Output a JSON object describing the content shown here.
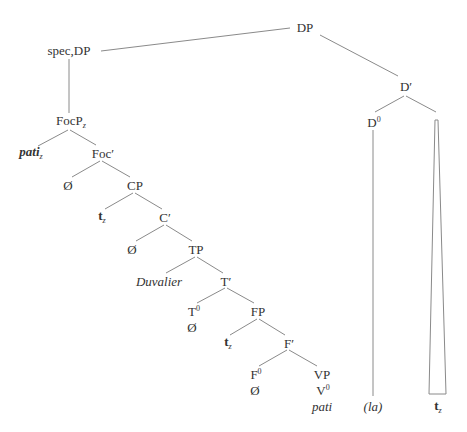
{
  "diagram": {
    "type": "syntax-tree",
    "line_color": "#8a8a8a",
    "text_color": "#333333",
    "nodes": {
      "dp": {
        "label": "DP",
        "x": 305,
        "y": 27
      },
      "spec_dp": {
        "label": "spec,DP",
        "x": 69,
        "y": 50
      },
      "d_bar": {
        "label": "D′",
        "x": 406,
        "y": 85
      },
      "d0": {
        "label": "D",
        "sup": "0",
        "x": 372,
        "y": 121
      },
      "focp": {
        "label": "FocP",
        "sub": "z",
        "x": 69,
        "y": 121
      },
      "pati_z": {
        "label": "pati",
        "sub": "z",
        "x": 30,
        "y": 152
      },
      "foc_bar": {
        "label": "Foc′",
        "x": 101,
        "y": 152
      },
      "null_foc": {
        "label": "Ø",
        "x": 68,
        "y": 184
      },
      "cp": {
        "label": "CP",
        "x": 134,
        "y": 184
      },
      "t_z_cp": {
        "label": "t",
        "sub": "z",
        "x": 101,
        "y": 216
      },
      "c_bar": {
        "label": "C′",
        "x": 165,
        "y": 216
      },
      "null_c": {
        "label": "Ø",
        "x": 132,
        "y": 248
      },
      "tp": {
        "label": "TP",
        "x": 196,
        "y": 248
      },
      "duvalier": {
        "label": "Duvalier",
        "x": 160,
        "y": 280
      },
      "t_bar": {
        "label": "T′",
        "x": 226,
        "y": 280
      },
      "t0": {
        "label": "T",
        "sup": "0",
        "x": 193,
        "y": 310
      },
      "null_t": {
        "label": "Ø",
        "x": 193,
        "y": 326
      },
      "fp": {
        "label": "FP",
        "x": 258,
        "y": 310
      },
      "t_z_fp": {
        "label": "t",
        "sub": "z",
        "x": 227,
        "y": 342
      },
      "f_bar": {
        "label": "F′",
        "x": 288,
        "y": 342
      },
      "f0": {
        "label": "F",
        "sup": "0",
        "x": 255,
        "y": 373
      },
      "null_f": {
        "label": "Ø",
        "x": 255,
        "y": 390
      },
      "vp": {
        "label": "VP",
        "x": 322,
        "y": 373
      },
      "v0": {
        "label": "V",
        "sup": "0",
        "x": 322,
        "y": 390
      },
      "pati": {
        "label": "pati",
        "x": 322,
        "y": 406
      },
      "la": {
        "label": "(la)",
        "x": 373,
        "y": 406
      },
      "t_z_np": {
        "label": "t",
        "sub": "z",
        "x": 437,
        "y": 408
      }
    },
    "edges": [
      [
        "dp",
        "spec_dp"
      ],
      [
        "dp",
        "d_bar"
      ],
      [
        "d_bar",
        "d0"
      ],
      [
        "spec_dp",
        "focp"
      ],
      [
        "focp",
        "pati_z"
      ],
      [
        "focp",
        "foc_bar"
      ],
      [
        "foc_bar",
        "null_foc"
      ],
      [
        "foc_bar",
        "cp"
      ],
      [
        "cp",
        "t_z_cp"
      ],
      [
        "cp",
        "c_bar"
      ],
      [
        "c_bar",
        "null_c"
      ],
      [
        "c_bar",
        "tp"
      ],
      [
        "tp",
        "duvalier"
      ],
      [
        "tp",
        "t_bar"
      ],
      [
        "t_bar",
        "t0"
      ],
      [
        "t_bar",
        "fp"
      ],
      [
        "fp",
        "t_z_fp"
      ],
      [
        "fp",
        "f_bar"
      ],
      [
        "f_bar",
        "f0"
      ],
      [
        "f_bar",
        "vp"
      ],
      [
        "d0",
        "la"
      ]
    ],
    "triangle": {
      "apex_x": 437,
      "apex_y": 123,
      "base_left": 429,
      "base_right": 446,
      "base_y": 394,
      "child": "t_z_np"
    }
  }
}
